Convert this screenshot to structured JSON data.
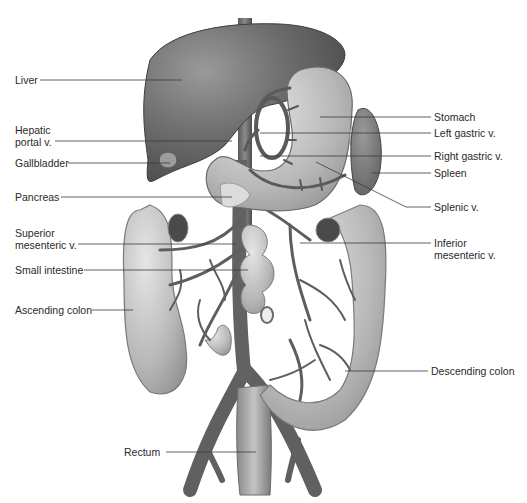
{
  "diagram": {
    "labels_left": [
      {
        "id": "liver",
        "text": "Liver"
      },
      {
        "id": "hepatic-portal-v",
        "text": "Hepatic\nportal v."
      },
      {
        "id": "gallbladder",
        "text": "Gallbladder"
      },
      {
        "id": "pancreas",
        "text": "Pancreas"
      },
      {
        "id": "superior-mesenteric-v",
        "text": "Superior\nmesenteric v."
      },
      {
        "id": "small-intestine",
        "text": "Small intestine"
      },
      {
        "id": "ascending-colon",
        "text": "Ascending colon"
      }
    ],
    "labels_right": [
      {
        "id": "stomach",
        "text": "Stomach"
      },
      {
        "id": "left-gastric-v",
        "text": "Left gastric v."
      },
      {
        "id": "right-gastric-v",
        "text": "Right gastric v."
      },
      {
        "id": "spleen",
        "text": "Spleen"
      },
      {
        "id": "splenic-v",
        "text": "Splenic v."
      },
      {
        "id": "inferior-mesenteric-v",
        "text": "Inferior\nmesenteric v."
      },
      {
        "id": "descending-colon",
        "text": "Descending colon"
      }
    ],
    "labels_bottom": [
      {
        "id": "rectum",
        "text": "Rectum"
      }
    ]
  }
}
